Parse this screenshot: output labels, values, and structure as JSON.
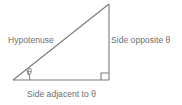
{
  "figure": {
    "background_color": "#ffffff",
    "line_color": "#7a7a7a",
    "text_color": "#6d6d6d",
    "labels": {
      "hypotenuse": "Hypotenuse",
      "side_opposite": "Side opposite θ",
      "side_adjacent": "Side adjacent to θ",
      "angle_theta": "θ"
    },
    "markers": {
      "right_angle": "right-angle-square",
      "angle_arc": "theta-angle-arc"
    },
    "geometry": {
      "vertex_left": [
        13,
        80
      ],
      "vertex_bottom_right": [
        109,
        80
      ],
      "vertex_apex": [
        109,
        4
      ],
      "right_angle_square_size": 7,
      "angle_arc_radius": 17
    }
  }
}
